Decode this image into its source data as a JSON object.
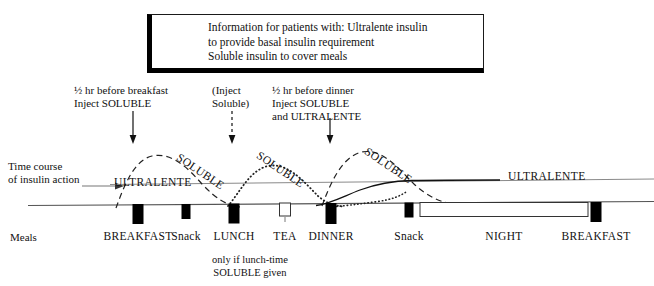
{
  "info_box": {
    "line1": "Information for patients with: Ultralente insulin",
    "line2": "to provide basal insulin requirement",
    "line3": "Soluble insulin to cover meals"
  },
  "annotations": {
    "inject_breakfast": {
      "line1": "½ hr before breakfast",
      "line2": "Inject  SOLUBLE",
      "arrow_style": "solid",
      "x": 133
    },
    "inject_lunch": {
      "line1": "(Inject",
      "line2": "Soluble)",
      "arrow_style": "dashed",
      "x": 232
    },
    "inject_dinner": {
      "line1": "½ hr before dinner",
      "line2": "Inject  SOLUBLE",
      "line3": "and ULTRALENTE",
      "arrow_style": "solid",
      "x": 330
    }
  },
  "axis": {
    "side_label_line1": "Time course",
    "side_label_line2": "of insulin action"
  },
  "curve_labels": {
    "ultralente_left": "ULTRALENTE",
    "ultralente_right": "ULTRALENTE",
    "soluble_breakfast": "SOLUBLE",
    "soluble_lunch": "SOLUBLE",
    "soluble_dinner": "SOLUBLE"
  },
  "meals": {
    "row_label": "Meals",
    "footnote_line1": "only if lunch-time",
    "footnote_line2": "SOLUBLE given",
    "items": [
      {
        "label": "BREAKFAST",
        "x": 138,
        "style": "solid",
        "width": 11
      },
      {
        "label": "Snack",
        "x": 186,
        "style": "solid",
        "width": 9
      },
      {
        "label": "LUNCH",
        "x": 234,
        "style": "solid",
        "width": 11
      },
      {
        "label": "TEA",
        "x": 285,
        "style": "hollow",
        "width": 11
      },
      {
        "label": "DINNER",
        "x": 331,
        "style": "solid",
        "width": 11
      },
      {
        "label": "Snack",
        "x": 409,
        "style": "solid",
        "width": 9
      },
      {
        "label": "NIGHT",
        "x": 504,
        "style": "hollow",
        "width": 168
      },
      {
        "label": "BREAKFAST",
        "x": 596,
        "style": "solid",
        "width": 11
      }
    ]
  },
  "chart_data": {
    "type": "line",
    "title": "Time course of insulin action",
    "xlabel": "Meals",
    "ylabel": "Insulin action",
    "grid": false,
    "legend": "inline-labels",
    "series": [
      {
        "name": "ULTRALENTE (basal)",
        "style": "solid-gray-flat",
        "description": "Flat basal level across the whole day"
      },
      {
        "name": "SOLUBLE breakfast",
        "style": "dashed",
        "peak_at": "BREAKFAST",
        "description": "Rises from breakfast injection, peaks mid-morning, falls before lunch"
      },
      {
        "name": "SOLUBLE lunch",
        "style": "dotted",
        "peak_at": "LUNCH",
        "description": "Optional lunch-time dose, peaks mid-afternoon"
      },
      {
        "name": "SOLUBLE dinner",
        "style": "dashed",
        "peak_at": "DINNER",
        "description": "Rises from dinner injection, peaks in the evening"
      },
      {
        "name": "ULTRALENTE evening dose",
        "style": "solid-black",
        "peak_at": "DINNER",
        "description": "Rises after the evening injection and merges into the basal line overnight"
      }
    ]
  },
  "colors": {
    "ink": "#111111",
    "basal_line": "#6e6e6e",
    "background": "#ffffff"
  }
}
